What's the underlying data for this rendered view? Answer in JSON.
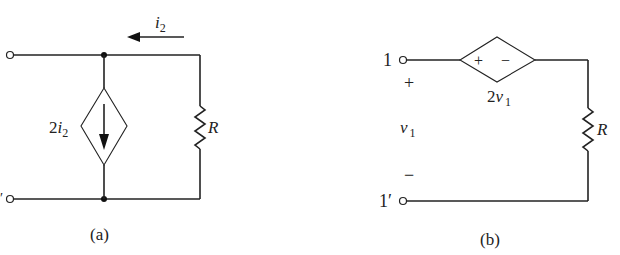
{
  "figure_a": {
    "caption": "(a)",
    "current_label": "i",
    "current_sub": "2",
    "source_label_coef": "2",
    "source_label_var": "i",
    "source_label_sub": "2",
    "resistor_label": "R",
    "bottom_terminal_mark": "′",
    "source_type": "dependent current source",
    "source_arrow": "down"
  },
  "figure_b": {
    "caption": "(b)",
    "terminal_top": "1",
    "terminal_bottom": "1′",
    "plus": "+",
    "minus": "−",
    "v_label": "v",
    "v_sub": "1",
    "source_plus": "+",
    "source_minus": "−",
    "source_label_coef": "2",
    "source_label_var": "v",
    "source_label_sub": "1",
    "resistor_label": "R",
    "source_type": "dependent voltage source"
  }
}
